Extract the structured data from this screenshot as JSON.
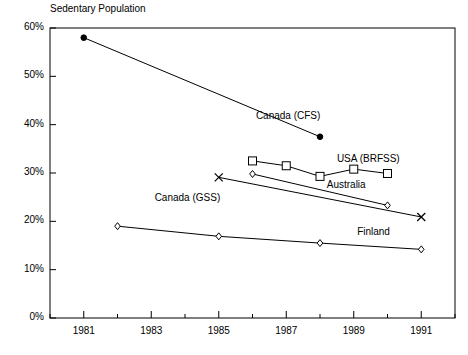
{
  "chart_data": {
    "type": "line",
    "title": "Sedentary Population",
    "xlabel": "",
    "ylabel": "",
    "xlim": [
      1980,
      1992
    ],
    "ylim": [
      0,
      60
    ],
    "grid": false,
    "legend_position": "inline-annotations",
    "y_tick_labels": [
      "0%",
      "10%",
      "20%",
      "30%",
      "40%",
      "50%",
      "60%"
    ],
    "y_tick_values": [
      0,
      10,
      20,
      30,
      40,
      50,
      60
    ],
    "x_tick_values": [
      1980,
      1981,
      1982,
      1983,
      1984,
      1985,
      1986,
      1987,
      1988,
      1989,
      1990,
      1991,
      1992
    ],
    "x_tick_labels_shown": [
      "1981",
      "1983",
      "1985",
      "1987",
      "1989",
      "1991"
    ],
    "x_tick_label_values": [
      1981,
      1983,
      1985,
      1987,
      1989,
      1991
    ],
    "series": [
      {
        "name": "Canada (CFS)",
        "marker": "filled-circle",
        "label_x": 1986.1,
        "label_y": 41.5,
        "x": [
          1981,
          1988
        ],
        "values": [
          58,
          37.5
        ]
      },
      {
        "name": "USA (BRFSS)",
        "marker": "open-square",
        "label_x": 1988.5,
        "label_y": 32.6,
        "x": [
          1986,
          1987,
          1988,
          1989,
          1990
        ],
        "values": [
          32.5,
          31.5,
          29.3,
          30.8,
          29.9
        ]
      },
      {
        "name": "Australia",
        "marker": "open-diamond",
        "label_x": 1988.2,
        "label_y": 27.3,
        "x": [
          1986,
          1990
        ],
        "values": [
          29.8,
          23.3
        ]
      },
      {
        "name": "Canada (GSS)",
        "marker": "cross-x",
        "label_x": 1983.1,
        "label_y": 24.6,
        "x": [
          1985,
          1991
        ],
        "values": [
          29.1,
          20.9
        ]
      },
      {
        "name": "Finland",
        "marker": "open-diamond",
        "label_x": 1989.1,
        "label_y": 17.5,
        "x": [
          1982,
          1985,
          1988,
          1991
        ],
        "values": [
          19.0,
          16.9,
          15.5,
          14.2
        ]
      }
    ]
  }
}
